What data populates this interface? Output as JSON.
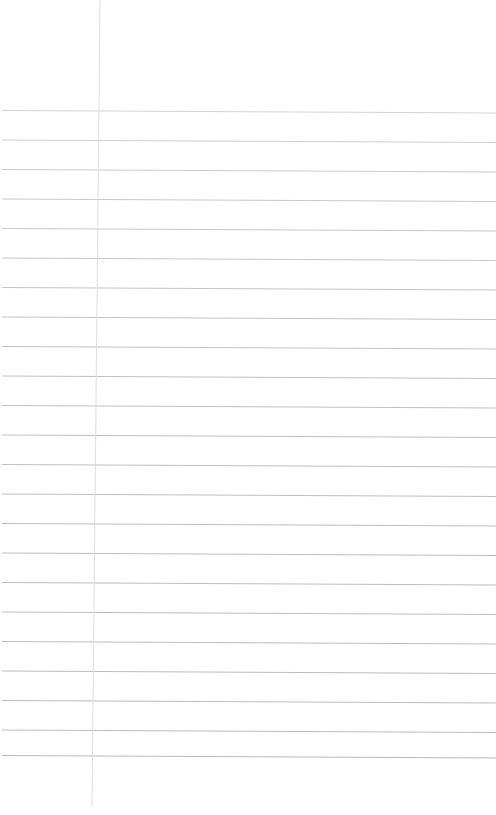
{
  "document": {
    "kind": "scanned-blank-lined-paper",
    "title": "Blank Lined Notebook Paper",
    "page_width": 496,
    "page_height": 815,
    "background_color": "#ffffff",
    "content_text": "",
    "has_handwriting": false,
    "has_printed_text": false
  },
  "ruling": {
    "style": "college-ruled",
    "horizontal_rule_color": "#b9b9bd",
    "horizontal_rule_color_faint": "#cfcfd4",
    "horizontal_rule_width": 1,
    "margin_rule_color": "#dedee2",
    "margin_rule_width": 1,
    "line_spacing": 29.5,
    "first_line_y": 110.5,
    "line_count": 22,
    "skew_rise_px": -2.5,
    "left_inset": 2,
    "right_inset": 0,
    "top_blank_height": 110,
    "bottom_blank_height": 60
  },
  "margin_line": {
    "name": "vertical-margin-rule",
    "x_top": 100,
    "x_bottom": 92,
    "y_start": 0,
    "y_end": 806,
    "color": "#dedee2"
  },
  "horizontal_lines": [
    {
      "index": 1,
      "y_left": 110.5,
      "y_right": 113.0,
      "opacity": 0.62
    },
    {
      "index": 2,
      "y_left": 140.0,
      "y_right": 142.5,
      "opacity": 0.7
    },
    {
      "index": 3,
      "y_left": 169.5,
      "y_right": 172.0,
      "opacity": 0.74
    },
    {
      "index": 4,
      "y_left": 199.0,
      "y_right": 201.5,
      "opacity": 0.78
    },
    {
      "index": 5,
      "y_left": 228.5,
      "y_right": 231.0,
      "opacity": 0.8
    },
    {
      "index": 6,
      "y_left": 258.0,
      "y_right": 260.5,
      "opacity": 0.82
    },
    {
      "index": 7,
      "y_left": 287.5,
      "y_right": 290.0,
      "opacity": 0.84
    },
    {
      "index": 8,
      "y_left": 317.0,
      "y_right": 319.5,
      "opacity": 0.86
    },
    {
      "index": 9,
      "y_left": 346.5,
      "y_right": 349.0,
      "opacity": 0.88
    },
    {
      "index": 10,
      "y_left": 376.0,
      "y_right": 378.5,
      "opacity": 0.9
    },
    {
      "index": 11,
      "y_left": 405.5,
      "y_right": 408.0,
      "opacity": 0.9
    },
    {
      "index": 12,
      "y_left": 435.0,
      "y_right": 437.5,
      "opacity": 0.92
    },
    {
      "index": 13,
      "y_left": 464.5,
      "y_right": 467.0,
      "opacity": 0.92
    },
    {
      "index": 14,
      "y_left": 494.0,
      "y_right": 496.5,
      "opacity": 0.92
    },
    {
      "index": 15,
      "y_left": 523.5,
      "y_right": 526.0,
      "opacity": 0.94
    },
    {
      "index": 16,
      "y_left": 553.0,
      "y_right": 555.5,
      "opacity": 0.94
    },
    {
      "index": 17,
      "y_left": 582.5,
      "y_right": 585.0,
      "opacity": 0.94
    },
    {
      "index": 18,
      "y_left": 612.0,
      "y_right": 614.5,
      "opacity": 0.95
    },
    {
      "index": 19,
      "y_left": 641.5,
      "y_right": 644.0,
      "opacity": 0.95
    },
    {
      "index": 20,
      "y_left": 671.0,
      "y_right": 673.5,
      "opacity": 0.96
    },
    {
      "index": 21,
      "y_left": 700.5,
      "y_right": 703.0,
      "opacity": 0.97
    },
    {
      "index": 22,
      "y_left": 730.0,
      "y_right": 732.5,
      "opacity": 0.97
    },
    {
      "index": 23,
      "y_left": 755.5,
      "y_right": 758.0,
      "opacity": 0.98
    }
  ]
}
